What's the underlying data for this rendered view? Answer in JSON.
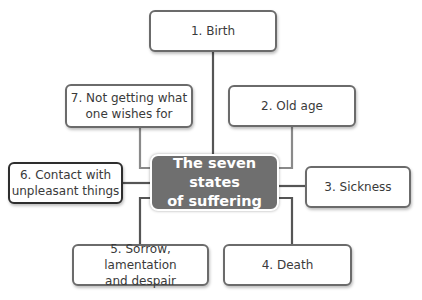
{
  "diagram": {
    "center": {
      "line1": "The seven states",
      "line2": "of suffering"
    },
    "nodes": [
      {
        "id": 1,
        "line1": "1. Birth",
        "line2": ""
      },
      {
        "id": 2,
        "line1": "2. Old age",
        "line2": ""
      },
      {
        "id": 3,
        "line1": "3. Sickness",
        "line2": ""
      },
      {
        "id": 4,
        "line1": "4. Death",
        "line2": ""
      },
      {
        "id": 5,
        "line1": "5. Sorrow, lamentation",
        "line2": "and despair"
      },
      {
        "id": 6,
        "line1": "6. Contact with",
        "line2": "unpleasant things"
      },
      {
        "id": 7,
        "line1": "7. Not getting what",
        "line2": "one wishes for"
      }
    ],
    "colors": {
      "center_fill": "#6f6f6f",
      "border": "#6b6b6b",
      "connector": "#555555"
    }
  }
}
